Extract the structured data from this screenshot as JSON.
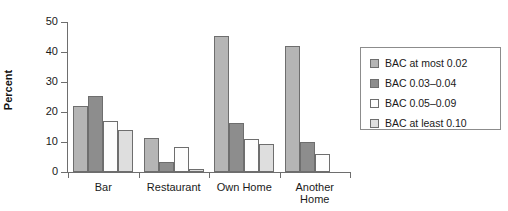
{
  "chart_data": {
    "type": "bar",
    "title": "",
    "xlabel": "",
    "ylabel": "Percent",
    "ylim": [
      0,
      50
    ],
    "yticks": [
      0,
      10,
      20,
      30,
      40,
      50
    ],
    "grid": false,
    "legend_position": "right",
    "categories": [
      "Bar",
      "Restaurant",
      "Own Home",
      "Another\nHome"
    ],
    "series": [
      {
        "name": "BAC at most 0.02",
        "color": "#b5b5b5",
        "values": [
          22,
          11.5,
          45.5,
          42
        ]
      },
      {
        "name": "BAC 0.03–0.04",
        "color": "#8d8d8d",
        "values": [
          25.5,
          3.5,
          16.5,
          10
        ]
      },
      {
        "name": "BAC 0.05–0.09",
        "color": "#fdfdfd",
        "values": [
          17,
          8.5,
          11,
          6
        ]
      },
      {
        "name": "BAC at least 0.10",
        "color": "#dedede",
        "values": [
          14,
          1,
          9.5,
          0
        ]
      }
    ]
  },
  "legend": {
    "items": [
      {
        "label": "BAC at most 0.02"
      },
      {
        "label": "BAC 0.03–0.04"
      },
      {
        "label": "BAC 0.05–0.09"
      },
      {
        "label": "BAC at least 0.10"
      }
    ]
  },
  "axis": {
    "y_title": "Percent",
    "y_tick_labels": [
      "0",
      "10",
      "20",
      "30",
      "40",
      "50"
    ],
    "x_tick_labels": [
      "Bar",
      "Restaurant",
      "Own Home",
      "Another\nHome"
    ]
  }
}
